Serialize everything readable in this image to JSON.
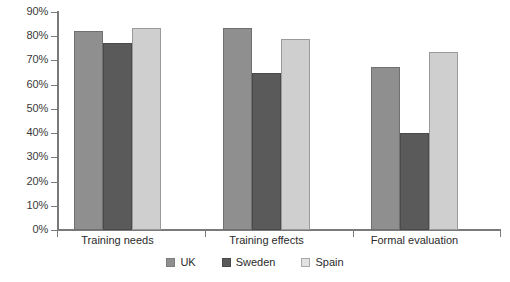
{
  "chart_data": {
    "type": "bar",
    "title": "",
    "subtitle": "",
    "xlabel": "",
    "ylabel": "",
    "categories": [
      "Training needs",
      "Training effects",
      "Formal evaluation"
    ],
    "series": [
      {
        "name": "UK",
        "color": "#8f8f8f",
        "values": [
          82,
          83.5,
          67.5
        ]
      },
      {
        "name": "Sweden",
        "color": "#5a5a5a",
        "values": [
          77,
          65,
          40
        ]
      },
      {
        "name": "Spain",
        "color": "#cfcfcf",
        "values": [
          83.5,
          79,
          73.5
        ]
      }
    ],
    "ylim": [
      0,
      90
    ],
    "ytick_values": [
      0,
      10,
      20,
      30,
      40,
      50,
      60,
      70,
      80,
      90
    ],
    "ytick_labels": [
      "0%",
      "10%",
      "20%",
      "30%",
      "40%",
      "50%",
      "60%",
      "70%",
      "80%",
      "90%"
    ],
    "grid": false,
    "legend_position": "bottom",
    "value_format": "percent"
  }
}
